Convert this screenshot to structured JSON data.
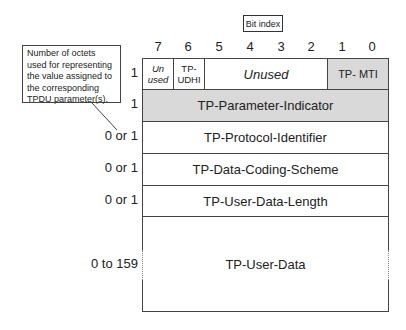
{
  "legend": {
    "bit_index_label": "Bit index",
    "note": "Number of octets used for representing the value assigned to the corresponding TPDU parameter(s)."
  },
  "bit_indices": [
    "7",
    "6",
    "5",
    "4",
    "3",
    "2",
    "1",
    "0"
  ],
  "rows": [
    {
      "octets": "1",
      "fields": [
        {
          "label": "Un used",
          "bits": "7",
          "style": "italic",
          "shaded": false
        },
        {
          "label": "TP- UDHI",
          "bits": "6",
          "shaded": false
        },
        {
          "label": "Unused",
          "bits": "5-2",
          "style": "italic",
          "shaded": false
        },
        {
          "label": "TP- MTI",
          "bits": "1-0",
          "shaded": true
        }
      ]
    },
    {
      "octets": "1",
      "label": "TP-Parameter-Indicator",
      "shaded": true
    },
    {
      "octets": "0 or 1",
      "label": "TP-Protocol-Identifier",
      "shaded": false
    },
    {
      "octets": "0 or 1",
      "label": "TP-Data-Coding-Scheme",
      "shaded": false
    },
    {
      "octets": "0 or 1",
      "label": "TP-User-Data-Length",
      "shaded": false
    },
    {
      "octets": "0 to 159",
      "label": "TP-User-Data",
      "shaded": false
    }
  ],
  "colors": {
    "shaded": "#d9d9d9",
    "border": "#444444"
  }
}
